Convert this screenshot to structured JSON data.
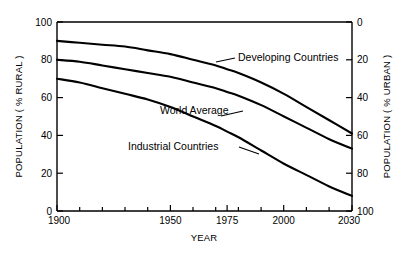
{
  "chart_data": {
    "type": "line",
    "title": "",
    "xlabel": "YEAR",
    "ylabel": "POPULATION ( % RURAL )",
    "ylabel_right": "POPULATION ( % URBAN )",
    "xlim": [
      1900,
      2030
    ],
    "ylim": [
      0,
      100
    ],
    "ylim_right": [
      100,
      0
    ],
    "grid": false,
    "legend_position": "inline-annotations",
    "x_ticks": [
      1900,
      1950,
      1975,
      2000,
      2030
    ],
    "x_tick_labels": [
      "1900",
      "1950",
      "1975",
      "2000",
      "2030"
    ],
    "x_minor_ticks": [
      1910,
      1920,
      1930,
      1940,
      1960,
      1970,
      1980,
      1990,
      2010,
      2020
    ],
    "y_ticks": [
      0,
      20,
      40,
      60,
      80,
      100
    ],
    "y_tick_labels": [
      "0",
      "20",
      "40",
      "60",
      "80",
      "100"
    ],
    "y_ticks_right": [
      0,
      20,
      40,
      60,
      80,
      100
    ],
    "y_tick_labels_right": [
      "0",
      "20",
      "40",
      "60",
      "80",
      "100"
    ],
    "x": [
      1900,
      1910,
      1920,
      1930,
      1940,
      1950,
      1960,
      1970,
      1975,
      1980,
      1990,
      2000,
      2010,
      2020,
      2030
    ],
    "series": [
      {
        "name": "Developing Countries",
        "values": [
          90,
          89,
          88,
          87,
          85,
          83,
          80,
          77,
          75,
          73,
          68,
          62,
          55,
          48,
          41
        ]
      },
      {
        "name": "World Average",
        "values": [
          80,
          79,
          77,
          75,
          73,
          71,
          68,
          65,
          63,
          61,
          56,
          50,
          44,
          38,
          33
        ]
      },
      {
        "name": "Industrial Countries",
        "values": [
          70,
          68,
          65,
          62,
          59,
          55,
          50,
          45,
          42,
          39,
          32,
          25,
          19,
          13,
          8
        ]
      }
    ],
    "annotations": [
      {
        "text": "Developing Countries",
        "target_series": "Developing Countries"
      },
      {
        "text": "World Average",
        "target_series": "World Average"
      },
      {
        "text": "Industrial Countries",
        "target_series": "Industrial Countries"
      }
    ],
    "colors": {
      "line": "#000000",
      "axis": "#000000",
      "background": "#ffffff"
    }
  }
}
